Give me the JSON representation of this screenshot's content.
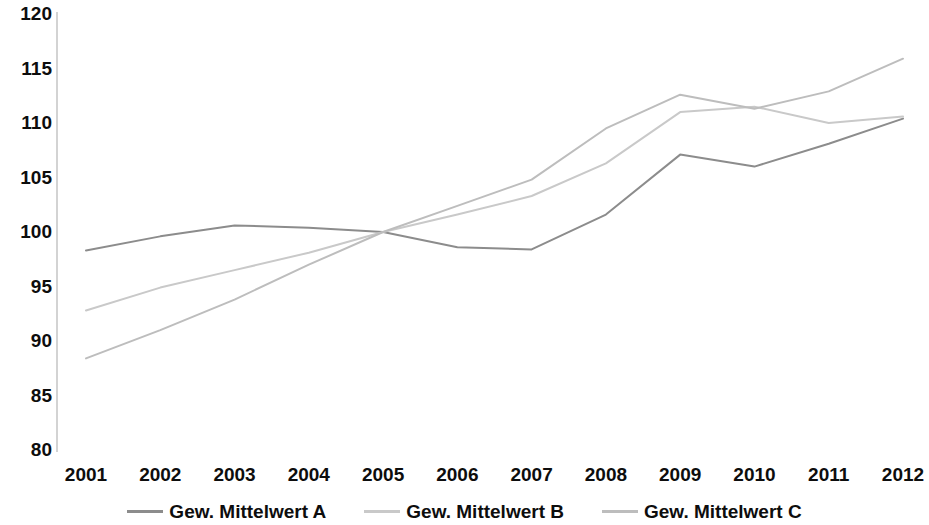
{
  "chart_data": {
    "type": "line",
    "title": "",
    "xlabel": "",
    "ylabel": "",
    "categories": [
      "2001",
      "2002",
      "2003",
      "2004",
      "2005",
      "2006",
      "2007",
      "2008",
      "2009",
      "2010",
      "2011",
      "2012"
    ],
    "ylim": [
      80,
      120
    ],
    "xlim": [
      "2001",
      "2012"
    ],
    "y_ticks": [
      "120",
      "115",
      "110",
      "105",
      "100",
      "95",
      "90",
      "85",
      "80"
    ],
    "y_tick_values": [
      120,
      115,
      110,
      105,
      100,
      95,
      90,
      85,
      80
    ],
    "grid": false,
    "legend_position": "bottom",
    "series": [
      {
        "name": "Gew. Mittelwert A",
        "color": "#8c8c8c",
        "values": [
          98.3,
          99.6,
          100.6,
          100.4,
          100.0,
          98.6,
          98.4,
          101.6,
          107.1,
          106.0,
          108.1,
          110.4
        ]
      },
      {
        "name": "Gew. Mittelwert B",
        "color": "#c9c9c9",
        "values": [
          92.8,
          94.9,
          96.5,
          98.1,
          100.0,
          101.6,
          103.3,
          106.3,
          111.0,
          111.5,
          110.0,
          110.6
        ]
      },
      {
        "name": "Gew. Mittelwert C",
        "color": "#bdbdbd",
        "values": [
          88.4,
          91.0,
          93.8,
          97.0,
          100.0,
          102.4,
          104.8,
          109.5,
          112.6,
          111.3,
          112.9,
          115.9
        ]
      }
    ]
  },
  "axis": {
    "axis_line_color": "#bfbfbf"
  },
  "legend": {
    "entries": [
      {
        "label": "Gew. Mittelwert A"
      },
      {
        "label": "Gew. Mittelwert B"
      },
      {
        "label": "Gew. Mittelwert C"
      }
    ]
  }
}
